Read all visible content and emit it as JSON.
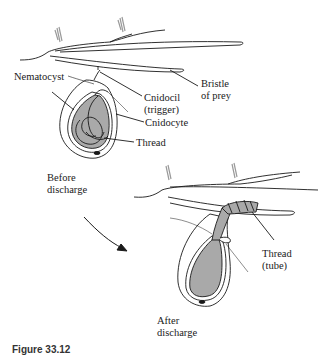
{
  "diagram": {
    "stages": {
      "before": {
        "label_line1": "Before",
        "label_line2": "discharge"
      },
      "after": {
        "label_line1": "After",
        "label_line2": "discharge"
      }
    },
    "labels": {
      "nematocyst": "Nematocyst",
      "cnidocil_line1": "Cnidocil",
      "cnidocil_line2": "(trigger)",
      "bristle_line1": "Bristle",
      "bristle_line2": "of prey",
      "cnidocyte": "Cnidocyte",
      "thread": "Thread",
      "thread_tube_line1": "Thread",
      "thread_tube_line2": "(tube)"
    },
    "caption": "Figure 33.12",
    "colors": {
      "stroke": "#1a1a1a",
      "capsule_fill": "#a9a9a9",
      "hair": "#9a9a9a",
      "background": "#ffffff"
    }
  }
}
